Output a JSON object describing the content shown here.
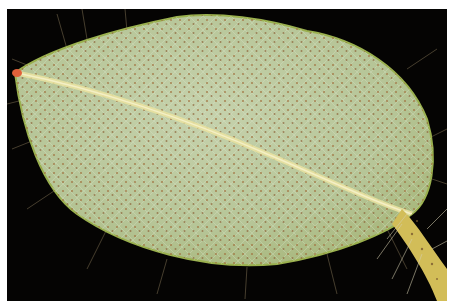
{
  "image": {
    "subject": "Underside of a hairy leaf with scattered reddish-brown glandular dots",
    "alt": "Close-up photograph of a leaf underside on a black background",
    "colors": {
      "background": "#050403",
      "leaf_base": "#b9c79a",
      "leaf_light": "#c9d3b0",
      "midrib": "#e6df9a",
      "dots": "#9a6a3a",
      "petiole": "#d8c25a",
      "tip": "#e0603a",
      "border": "#ffffff"
    }
  }
}
